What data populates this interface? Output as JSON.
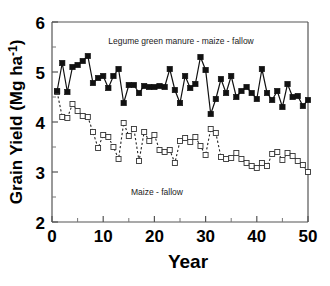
{
  "chart_data": {
    "type": "line",
    "title": "",
    "xlabel": "Year",
    "ylabel": "Grain Yield (Mg ha-1)",
    "ylabel_base": "Grain Yield (Mg ha",
    "ylabel_exponent": "-1",
    "ylabel_close": ")",
    "xlim": [
      0,
      50
    ],
    "ylim": [
      2,
      6
    ],
    "xticks": [
      0,
      10,
      20,
      30,
      40,
      50
    ],
    "xtick_labels": [
      "0",
      "10",
      "20",
      "30",
      "40",
      "50"
    ],
    "xticks_minor": [
      5,
      15,
      25,
      35,
      45
    ],
    "yticks": [
      2,
      3,
      4,
      5,
      6
    ],
    "ytick_labels": [
      "2",
      "3",
      "4",
      "5",
      "6"
    ],
    "yticks_minor": [
      2.5,
      3.5,
      4.5,
      5.5
    ],
    "grid": false,
    "legend_position": "inline-annotation",
    "x": [
      1,
      2,
      3,
      4,
      5,
      6,
      7,
      8,
      9,
      10,
      11,
      12,
      13,
      14,
      15,
      16,
      17,
      18,
      19,
      20,
      21,
      22,
      23,
      24,
      25,
      26,
      27,
      28,
      29,
      30,
      31,
      32,
      33,
      34,
      35,
      36,
      37,
      38,
      39,
      40,
      41,
      42,
      43,
      44,
      45,
      46,
      47,
      48,
      49,
      50
    ],
    "series": [
      {
        "name": "Legume green manure - maize - fallow",
        "marker": "filled-square",
        "linestyle": "solid",
        "annotation": "Legume green manure - maize - fallow",
        "values": [
          4.62,
          5.18,
          4.6,
          5.1,
          5.14,
          5.22,
          5.32,
          4.78,
          4.88,
          4.92,
          4.68,
          4.92,
          5.06,
          4.38,
          4.74,
          4.74,
          4.58,
          4.72,
          4.7,
          4.7,
          4.72,
          4.7,
          5.06,
          4.64,
          4.38,
          4.92,
          4.68,
          4.76,
          5.3,
          5.04,
          4.16,
          4.46,
          4.86,
          4.58,
          4.92,
          4.5,
          4.62,
          4.7,
          4.58,
          4.46,
          5.06,
          4.58,
          4.44,
          4.62,
          4.3,
          4.76,
          4.5,
          4.52,
          4.32,
          4.44
        ]
      },
      {
        "name": "Maize - fallow",
        "marker": "open-square",
        "linestyle": "dashed",
        "annotation": "Maize - fallow",
        "values": [
          4.6,
          4.1,
          4.08,
          4.36,
          4.22,
          4.12,
          4.1,
          3.8,
          3.48,
          3.74,
          3.7,
          3.5,
          3.26,
          3.98,
          3.72,
          3.86,
          3.22,
          3.8,
          3.62,
          3.74,
          3.44,
          3.4,
          3.44,
          3.18,
          3.62,
          3.68,
          3.6,
          3.7,
          3.52,
          3.34,
          3.86,
          3.78,
          3.3,
          3.26,
          3.28,
          3.38,
          3.26,
          3.18,
          3.12,
          3.08,
          3.18,
          3.12,
          3.36,
          3.4,
          3.24,
          3.38,
          3.32,
          3.22,
          3.14,
          3.0
        ]
      }
    ]
  },
  "annotations": {
    "top_series_label": "Legume green manure - maize - fallow",
    "bottom_series_label": "Maize - fallow"
  }
}
